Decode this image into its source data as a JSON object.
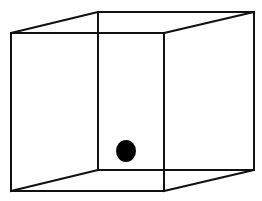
{
  "diagram": {
    "type": "wireframe-cube",
    "background": "#ffffff",
    "stroke_color": "#111111",
    "stroke_width": 2,
    "vertices": {
      "front_top_left": [
        11,
        33
      ],
      "front_top_right": [
        164,
        33
      ],
      "front_bottom_left": [
        11,
        191
      ],
      "front_bottom_right": [
        164,
        191
      ],
      "back_top_left": [
        98,
        12
      ],
      "back_top_right": [
        254,
        12
      ],
      "back_bottom_left": [
        98,
        170
      ],
      "back_bottom_right": [
        254,
        170
      ]
    },
    "edges": [
      [
        "front_top_left",
        "front_top_right"
      ],
      [
        "front_top_right",
        "front_bottom_right"
      ],
      [
        "front_bottom_right",
        "front_bottom_left"
      ],
      [
        "front_bottom_left",
        "front_top_left"
      ],
      [
        "back_top_left",
        "back_top_right"
      ],
      [
        "back_top_right",
        "back_bottom_right"
      ],
      [
        "back_bottom_right",
        "back_bottom_left"
      ],
      [
        "back_bottom_left",
        "back_top_left"
      ],
      [
        "front_top_left",
        "back_top_left"
      ],
      [
        "front_top_right",
        "back_top_right"
      ],
      [
        "front_bottom_left",
        "back_bottom_left"
      ],
      [
        "front_bottom_right",
        "back_bottom_right"
      ]
    ],
    "dot": {
      "center": [
        126,
        151
      ],
      "rx": 10,
      "ry": 11,
      "color": "#000000"
    }
  }
}
